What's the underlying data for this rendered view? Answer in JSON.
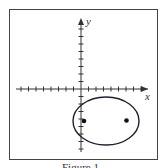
{
  "figure": {
    "caption": "Figure 1",
    "x_label": "x",
    "y_label": "y",
    "colors": {
      "frame": "#444444",
      "axes": "#333333",
      "ellipse": "#1e2030",
      "foci": "#111111"
    }
  },
  "chart_data": {
    "type": "scatter",
    "title": "",
    "xlabel": "x",
    "ylabel": "y",
    "grid": false,
    "xlim": [
      -9,
      9
    ],
    "ylim": [
      -8,
      9
    ],
    "x_ticks_per_side": 8,
    "y_ticks_above": 8,
    "y_ticks_below": 8,
    "curves": [
      {
        "name": "ellipse",
        "type": "ellipse",
        "center": [
          3,
          -4
        ],
        "semi_major": 4.4,
        "semi_minor": 3.2,
        "orientation": "horizontal"
      }
    ],
    "points": [
      {
        "name": "focus-left",
        "x": 0.3,
        "y": -4
      },
      {
        "name": "focus-right",
        "x": 6,
        "y": -4
      }
    ],
    "annotations": [
      "Figure 1"
    ]
  }
}
